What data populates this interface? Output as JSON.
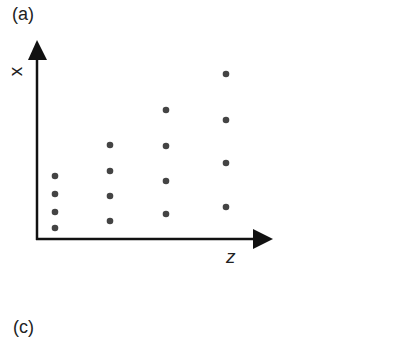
{
  "panels": [
    {
      "label": "(a)"
    },
    {
      "label": "(c)"
    }
  ],
  "chart_data": {
    "type": "scatter",
    "title": "",
    "panel_label": "(a)",
    "xlabel": "z",
    "ylabel": "x",
    "grid": false,
    "legend": null,
    "note": "Schematic with no tick labels; points arranged in 4 columns with increasing spread along x as z increases",
    "series": [
      {
        "name": "column 1",
        "z": 1,
        "x": [
          1.0,
          1.5,
          2.0,
          2.4
        ]
      },
      {
        "name": "column 2",
        "z": 2,
        "x": [
          1.2,
          1.9,
          2.6,
          3.3
        ]
      },
      {
        "name": "column 3",
        "z": 3,
        "x": [
          1.4,
          2.3,
          3.3,
          4.3
        ]
      },
      {
        "name": "column 4",
        "z": 4,
        "x": [
          1.6,
          2.8,
          4.0,
          5.3
        ]
      }
    ],
    "pixel_points": [
      {
        "cx": 55,
        "cy": [
          176,
          194,
          212,
          228
        ]
      },
      {
        "cx": 110,
        "cy": [
          145,
          171,
          196,
          221
        ]
      },
      {
        "cx": 166,
        "cy": [
          110,
          146,
          181,
          214
        ]
      },
      {
        "cx": 226,
        "cy": [
          74,
          120,
          163,
          207
        ]
      }
    ]
  }
}
